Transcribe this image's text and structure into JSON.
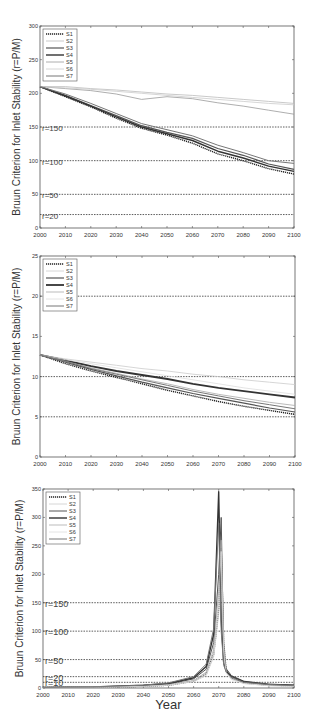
{
  "chart_data": [
    {
      "type": "line",
      "title": "",
      "xlabel": "",
      "ylabel": "Bruun Criterion for Inlet Stability (r=P/M)",
      "xlim": [
        2000,
        2100
      ],
      "ylim": [
        0,
        300
      ],
      "xticks": [
        2000,
        2010,
        2020,
        2030,
        2040,
        2050,
        2060,
        2070,
        2080,
        2090,
        2100
      ],
      "yticks": [
        0,
        50,
        100,
        150,
        200,
        250,
        300
      ],
      "grid": false,
      "legend_position": "upper-left",
      "reference_lines": [
        {
          "y": 150,
          "label": "r=150"
        },
        {
          "y": 100,
          "label": "r=100"
        },
        {
          "y": 50,
          "label": "r=50"
        },
        {
          "y": 20,
          "label": "r=20"
        }
      ],
      "x": [
        2000,
        2010,
        2020,
        2030,
        2040,
        2050,
        2060,
        2070,
        2080,
        2090,
        2100
      ],
      "series": [
        {
          "name": "S1",
          "style": "dotted",
          "color": "#222222",
          "width": 1.4,
          "values": [
            210,
            195,
            180,
            163,
            148,
            138,
            126,
            110,
            100,
            88,
            80
          ]
        },
        {
          "name": "S2",
          "style": "solid",
          "color": "#bbbbbb",
          "width": 0.8,
          "values": [
            210,
            210,
            207,
            205,
            202,
            199,
            197,
            194,
            191,
            188,
            185
          ]
        },
        {
          "name": "S3",
          "style": "solid",
          "color": "#555555",
          "width": 1.2,
          "values": [
            210,
            197,
            182,
            167,
            152,
            142,
            133,
            118,
            108,
            95,
            87
          ]
        },
        {
          "name": "S4",
          "style": "solid",
          "color": "#333333",
          "width": 1.4,
          "values": [
            210,
            196,
            181,
            165,
            150,
            140,
            130,
            114,
            104,
            92,
            84
          ]
        },
        {
          "name": "S5",
          "style": "solid",
          "color": "#999999",
          "width": 0.8,
          "values": [
            210,
            207,
            204,
            199,
            191,
            195,
            192,
            186,
            181,
            175,
            169
          ]
        },
        {
          "name": "S6",
          "style": "solid",
          "color": "#cccccc",
          "width": 0.8,
          "values": [
            210,
            208,
            206,
            203,
            200,
            197,
            194,
            191,
            188,
            185,
            183
          ]
        },
        {
          "name": "S7",
          "style": "solid",
          "color": "#777777",
          "width": 1.0,
          "values": [
            210,
            199,
            185,
            170,
            155,
            146,
            137,
            123,
            112,
            100,
            96
          ]
        }
      ]
    },
    {
      "type": "line",
      "title": "",
      "xlabel": "",
      "ylabel": "Bruun Criterion for Inlet Stability (r=P/M)",
      "xlim": [
        2000,
        2100
      ],
      "ylim": [
        0,
        25
      ],
      "xticks": [
        2000,
        2010,
        2020,
        2030,
        2040,
        2050,
        2060,
        2070,
        2080,
        2090,
        2100
      ],
      "yticks": [
        0,
        5,
        10,
        15,
        20,
        25
      ],
      "grid": false,
      "legend_position": "upper-left",
      "reference_lines": [
        {
          "y": 20,
          "label": ""
        },
        {
          "y": 10,
          "label": ""
        },
        {
          "y": 5,
          "label": ""
        }
      ],
      "x": [
        2000,
        2010,
        2020,
        2030,
        2040,
        2050,
        2060,
        2070,
        2080,
        2090,
        2100
      ],
      "series": [
        {
          "name": "S1",
          "style": "dotted",
          "color": "#222222",
          "width": 1.4,
          "values": [
            12.7,
            11.6,
            10.7,
            9.9,
            9.1,
            8.3,
            7.6,
            6.9,
            6.3,
            5.8,
            5.3
          ]
        },
        {
          "name": "S2",
          "style": "solid",
          "color": "#cccccc",
          "width": 0.8,
          "values": [
            12.7,
            12.2,
            11.8,
            11.4,
            11.0,
            10.7,
            10.3,
            10.0,
            9.6,
            9.3,
            9.0
          ]
        },
        {
          "name": "S3",
          "style": "solid",
          "color": "#555555",
          "width": 1.2,
          "values": [
            12.7,
            11.8,
            10.9,
            10.1,
            9.3,
            8.6,
            7.9,
            7.3,
            6.7,
            6.1,
            5.6
          ]
        },
        {
          "name": "S4",
          "style": "solid",
          "color": "#333333",
          "width": 1.8,
          "values": [
            12.7,
            12.0,
            11.3,
            10.7,
            10.2,
            9.7,
            9.1,
            8.6,
            8.2,
            7.8,
            7.4
          ]
        },
        {
          "name": "S5",
          "style": "solid",
          "color": "#aaaaaa",
          "width": 0.8,
          "values": [
            12.7,
            11.9,
            11.1,
            10.4,
            9.7,
            9.1,
            8.4,
            7.8,
            7.3,
            6.8,
            6.4
          ]
        },
        {
          "name": "S6",
          "style": "solid",
          "color": "#dddddd",
          "width": 0.8,
          "values": [
            12.7,
            12.1,
            11.6,
            11.1,
            10.6,
            10.1,
            9.6,
            9.1,
            8.6,
            8.2,
            7.8
          ]
        },
        {
          "name": "S7",
          "style": "solid",
          "color": "#777777",
          "width": 1.0,
          "values": [
            12.7,
            11.9,
            11.0,
            10.3,
            9.6,
            8.9,
            8.2,
            7.6,
            7.0,
            6.5,
            6.0
          ]
        }
      ]
    },
    {
      "type": "line",
      "title": "",
      "xlabel": "Year",
      "ylabel": "Bruun Criterion for Inlet Stability (r=P/M)",
      "xlim": [
        2000,
        2100
      ],
      "ylim": [
        0,
        350
      ],
      "xticks": [
        2000,
        2010,
        2020,
        2030,
        2040,
        2050,
        2060,
        2070,
        2080,
        2090,
        2100
      ],
      "yticks": [
        0,
        50,
        100,
        150,
        200,
        250,
        300,
        350
      ],
      "grid": false,
      "legend_position": "upper-left",
      "reference_lines": [
        {
          "y": 150,
          "label": "r=150"
        },
        {
          "y": 100,
          "label": "r=100"
        },
        {
          "y": 50,
          "label": "r=50"
        },
        {
          "y": 20,
          "label": "r=20"
        },
        {
          "y": 10,
          "label": "r=10"
        }
      ],
      "x": [
        2000,
        2020,
        2040,
        2050,
        2060,
        2065,
        2068,
        2070,
        2071,
        2072,
        2073,
        2075,
        2080,
        2090,
        2100
      ],
      "series": [
        {
          "name": "S1",
          "style": "dotted",
          "color": "#222222",
          "width": 1.4,
          "values": [
            1,
            1.5,
            3,
            5,
            12,
            25,
            60,
            140,
            245,
            80,
            30,
            18,
            9,
            5,
            4
          ]
        },
        {
          "name": "S2",
          "style": "solid",
          "color": "#cccccc",
          "width": 0.8,
          "values": [
            1,
            1.5,
            3,
            5,
            11,
            22,
            55,
            130,
            230,
            70,
            28,
            16,
            8,
            4,
            3
          ]
        },
        {
          "name": "S3",
          "style": "solid",
          "color": "#555555",
          "width": 1.0,
          "values": [
            1,
            2,
            4,
            7,
            16,
            33,
            80,
            200,
            300,
            60,
            34,
            22,
            12,
            7,
            5
          ]
        },
        {
          "name": "S4",
          "style": "solid",
          "color": "#333333",
          "width": 1.4,
          "values": [
            1,
            2,
            5,
            8,
            18,
            38,
            95,
            345,
            120,
            45,
            30,
            20,
            11,
            6,
            5
          ]
        },
        {
          "name": "S5",
          "style": "solid",
          "color": "#aaaaaa",
          "width": 0.8,
          "values": [
            1,
            1.5,
            3,
            6,
            13,
            28,
            68,
            170,
            260,
            65,
            28,
            17,
            9,
            5,
            4
          ]
        },
        {
          "name": "S6",
          "style": "solid",
          "color": "#dddddd",
          "width": 0.8,
          "values": [
            1,
            1.5,
            3,
            5,
            12,
            24,
            58,
            150,
            240,
            60,
            26,
            15,
            8,
            4,
            3
          ]
        },
        {
          "name": "S7",
          "style": "solid",
          "color": "#777777",
          "width": 1.0,
          "values": [
            1,
            2,
            5,
            9,
            20,
            42,
            105,
            290,
            100,
            40,
            28,
            19,
            10,
            6,
            4
          ]
        }
      ]
    }
  ],
  "panels": [
    {
      "layout": {
        "left": 40,
        "right": 294,
        "top": 26,
        "bottom": 228
      },
      "ref_label_size": 8
    },
    {
      "layout": {
        "left": 40,
        "right": 295,
        "top": 256,
        "bottom": 457
      },
      "ref_label_size": 8
    },
    {
      "layout": {
        "left": 43,
        "right": 294,
        "top": 489,
        "bottom": 688
      },
      "ref_label_size": 9
    }
  ]
}
